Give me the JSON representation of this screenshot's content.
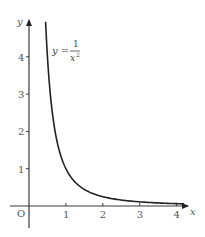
{
  "chart_data": {
    "type": "line",
    "title": "",
    "xlabel": "x",
    "ylabel": "y",
    "origin_label": "O",
    "xlim": [
      0,
      4.3
    ],
    "ylim": [
      0,
      5
    ],
    "x_ticks": [
      "1",
      "2",
      "3",
      "4"
    ],
    "y_ticks": [
      "1",
      "2",
      "3",
      "4"
    ],
    "grid": false,
    "legend": null,
    "annotation": {
      "text": "y = 1/x²",
      "lhs": "y =",
      "numerator": "1",
      "denominator": "x",
      "exponent": "2"
    },
    "series": [
      {
        "name": "y = 1/x^2",
        "x": [
          0.45,
          0.5,
          0.6,
          0.7,
          0.8,
          0.9,
          1.0,
          1.2,
          1.4,
          1.6,
          1.8,
          2.0,
          2.5,
          3.0,
          3.5,
          4.2
        ],
        "y": [
          4.94,
          4.0,
          2.78,
          2.04,
          1.56,
          1.23,
          1.0,
          0.69,
          0.51,
          0.39,
          0.31,
          0.25,
          0.16,
          0.11,
          0.08,
          0.06
        ]
      }
    ]
  }
}
